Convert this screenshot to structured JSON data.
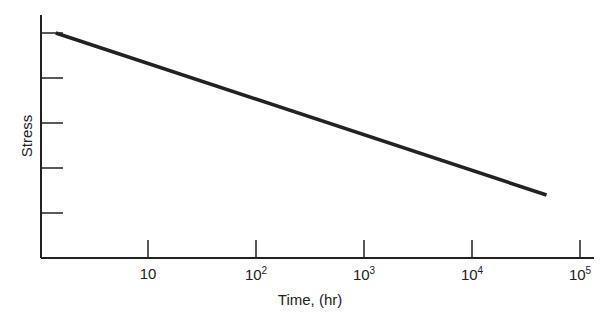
{
  "chart_data": {
    "type": "line",
    "title": "",
    "xlabel": "Time, (hr)",
    "ylabel": "Stress",
    "xscale": "log",
    "xlim": [
      1,
      100000
    ],
    "ylim": [
      0,
      5.5
    ],
    "x_ticks": [
      {
        "base": "10",
        "exp": "",
        "value": 10
      },
      {
        "base": "10",
        "exp": "2",
        "value": 100
      },
      {
        "base": "10",
        "exp": "3",
        "value": 1000
      },
      {
        "base": "10",
        "exp": "4",
        "value": 10000
      },
      {
        "base": "10",
        "exp": "5",
        "value": 100000
      }
    ],
    "y_ticks": [
      1,
      2,
      3,
      4,
      5
    ],
    "y_tick_labels_shown": false,
    "grid": false,
    "legend": null,
    "series": [
      {
        "name": "Stress vs time",
        "x": [
          1.4,
          49000
        ],
        "y": [
          5.0,
          1.4
        ],
        "color": "#222222"
      }
    ]
  }
}
